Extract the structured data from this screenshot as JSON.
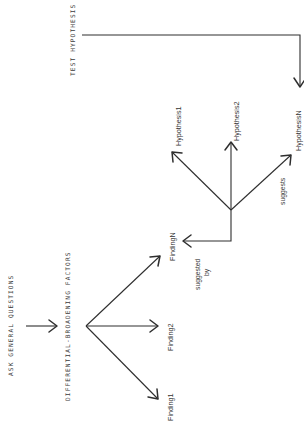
{
  "diagram": {
    "orientation": "rotated-90-ccw",
    "colors": {
      "ink": "#2e2e2e",
      "background": "#ffffff"
    },
    "steps": {
      "ask": "ASK GENERAL QUESTIONS",
      "differential": "DIFFERENTIAL-BROADENING FACTORS",
      "test": "TEST HYPOTHESIS"
    },
    "findings": [
      "Finding1",
      "Finding2",
      "FindingN"
    ],
    "hypotheses": [
      "Hypothesis1",
      "Hypothesis2",
      "HypothesisN"
    ],
    "edge_labels": {
      "suggested_by_line1": "suggested",
      "suggested_by_line2": "by",
      "suggests": "suggests"
    }
  }
}
